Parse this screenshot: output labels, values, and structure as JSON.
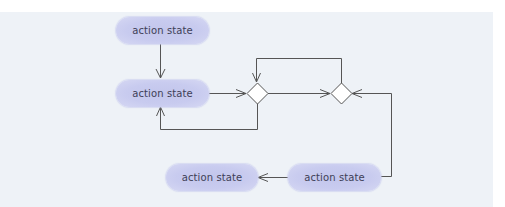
{
  "diagram": {
    "type": "UML activity diagram",
    "colors": {
      "background_panel": "#eef2f7",
      "node_fill": "#c8cbef",
      "edge": "#555555",
      "text": "#3e3f57"
    },
    "nodes": [
      {
        "id": "action1",
        "kind": "action",
        "label": "action state"
      },
      {
        "id": "action2",
        "kind": "action",
        "label": "action state"
      },
      {
        "id": "decision1",
        "kind": "decision",
        "label": ""
      },
      {
        "id": "decision2",
        "kind": "decision",
        "label": ""
      },
      {
        "id": "action3",
        "kind": "action",
        "label": "action state"
      },
      {
        "id": "action4",
        "kind": "action",
        "label": "action state"
      }
    ],
    "edges": [
      {
        "from": "action1",
        "to": "action2"
      },
      {
        "from": "action2",
        "to": "decision1"
      },
      {
        "from": "decision1",
        "to": "action2",
        "route": "below loop"
      },
      {
        "from": "decision2",
        "to": "decision1",
        "route": "above loop"
      },
      {
        "from": "decision1",
        "to": "decision2"
      },
      {
        "from": "action4",
        "to": "decision2",
        "route": "right side"
      },
      {
        "from": "action4",
        "to": "action3"
      }
    ]
  }
}
